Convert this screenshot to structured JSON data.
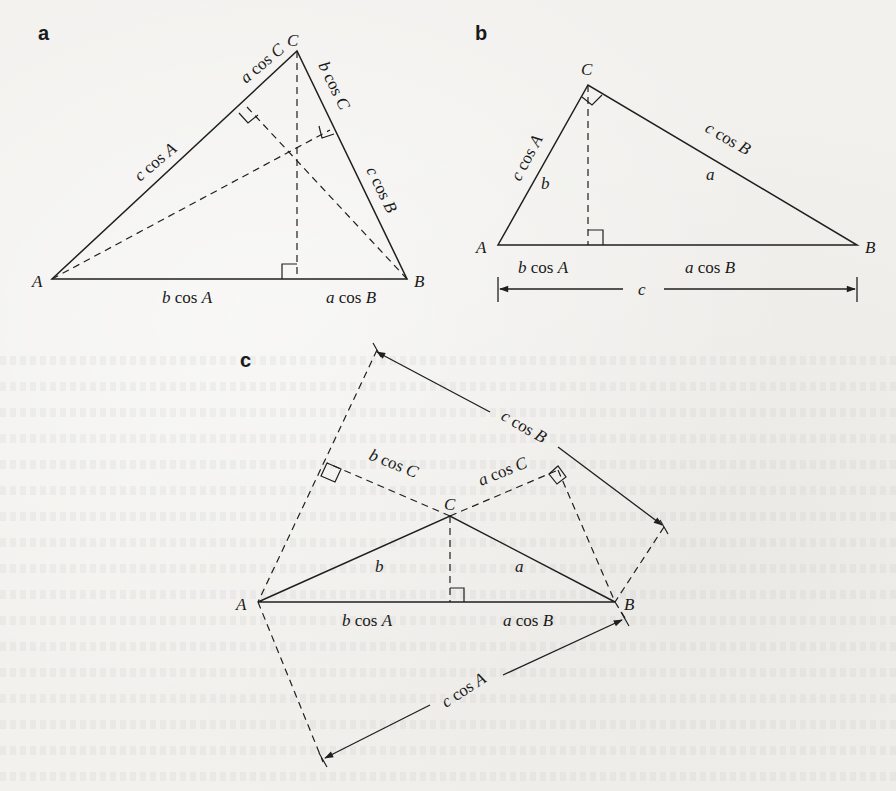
{
  "figure": {
    "panels": [
      {
        "id": "a",
        "label": "a",
        "vertices": {
          "A": "A",
          "B": "B",
          "C": "C"
        },
        "segment_labels": {
          "ac_lower": [
            "c",
            " cos ",
            "A"
          ],
          "ac_upper": [
            "a",
            " cos ",
            "C"
          ],
          "bc_upper": [
            "b",
            " cos ",
            "C"
          ],
          "bc_lower": [
            "c",
            " cos ",
            "B"
          ],
          "ab_left": [
            "b",
            " cos ",
            "A"
          ],
          "ab_right": [
            "a",
            " cos ",
            "B"
          ]
        }
      },
      {
        "id": "b",
        "label": "b",
        "vertices": {
          "A": "A",
          "B": "B",
          "C": "C"
        },
        "side_labels": {
          "b": "b",
          "a": "a",
          "c": "c"
        },
        "segment_labels": {
          "ac": [
            "c",
            " cos ",
            "A"
          ],
          "bc": [
            "c",
            " cos ",
            "B"
          ],
          "ab_left": [
            "b",
            " cos ",
            "A"
          ],
          "ab_right": [
            "a",
            " cos ",
            "B"
          ]
        }
      },
      {
        "id": "c",
        "label": "c",
        "vertices": {
          "A": "A",
          "B": "B",
          "C": "C"
        },
        "side_labels": {
          "b": "b",
          "a": "a"
        },
        "segment_labels": {
          "top": [
            "c",
            " cos ",
            "B"
          ],
          "left_proj": [
            "b",
            " cos ",
            "C"
          ],
          "right_proj": [
            "a",
            " cos ",
            "C"
          ],
          "ab_left": [
            "b",
            " cos ",
            "A"
          ],
          "ab_right": [
            "a",
            " cos ",
            "B"
          ],
          "bottom": [
            "c",
            " cos ",
            "A"
          ]
        }
      }
    ]
  }
}
